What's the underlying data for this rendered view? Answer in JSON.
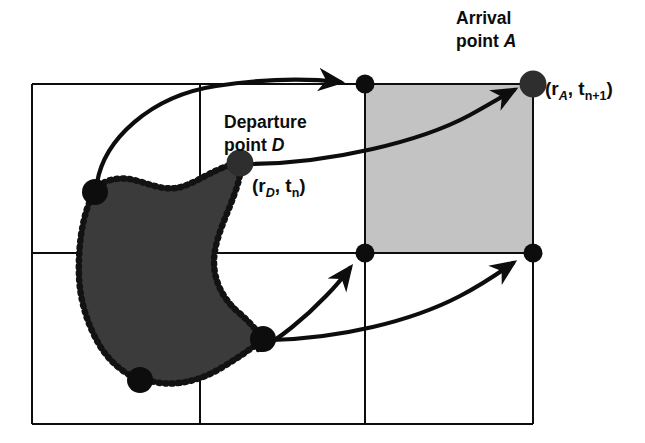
{
  "figure": {
    "kind": "semi-lagrangian-advection-diagram",
    "background_color": "#ffffff"
  },
  "labels": {
    "arrival_line1": "Arrival",
    "arrival_line2_prefix": "point ",
    "arrival_line2_symbol": "A",
    "arrival_coord_open": "(r",
    "arrival_coord_sub1": "A",
    "arrival_coord_mid": ", t",
    "arrival_coord_sub2": "n+1",
    "arrival_coord_close": ")",
    "departure_line1": "Departure",
    "departure_line2_prefix": "point ",
    "departure_line2_symbol": "D",
    "departure_coord_open": "(r",
    "departure_coord_sub1": "D",
    "departure_coord_mid": ", t",
    "departure_coord_sub2": "n",
    "departure_coord_close": ")"
  },
  "colors": {
    "grid_line": "#0d0d0d",
    "highlight_cell": "#c3c3c3",
    "blob_fill": "#3b3b3b",
    "blob_border": "#121212",
    "marker": "#0d0d0d",
    "arrow": "#0d0d0d",
    "text": "#0d0d0d",
    "background": "#ffffff"
  },
  "grid": {
    "x_lines": [
      32,
      200,
      365,
      533
    ],
    "y_lines": [
      84,
      253,
      424
    ],
    "line_width": 2.4,
    "columns": 3,
    "rows": 2
  },
  "highlight_cell": {
    "x": 365,
    "y": 84,
    "width": 168,
    "height": 169,
    "note": "shaded target grid cell containing arrival point A"
  },
  "markers": [
    {
      "name": "departure-point-D",
      "x": 240,
      "y": 163,
      "r": 13.5,
      "fill": "#2e2e2e"
    },
    {
      "name": "arrival-point-A",
      "x": 533,
      "y": 84,
      "r": 13.5,
      "fill": "#2e2e2e"
    },
    {
      "name": "blob-vertex-left",
      "x": 95,
      "y": 192,
      "r": 13.0,
      "fill": "#0d0d0d"
    },
    {
      "name": "blob-vertex-bottom-left",
      "x": 140,
      "y": 380,
      "r": 13.0,
      "fill": "#0d0d0d"
    },
    {
      "name": "blob-vertex-right",
      "x": 263,
      "y": 339,
      "r": 13.0,
      "fill": "#0d0d0d"
    },
    {
      "name": "grid-node-top-middle",
      "x": 365,
      "y": 84,
      "r": 9.5,
      "fill": "#0d0d0d"
    },
    {
      "name": "grid-node-center-right",
      "x": 365,
      "y": 253,
      "r": 9.5,
      "fill": "#0d0d0d"
    },
    {
      "name": "grid-node-middle-right",
      "x": 533,
      "y": 253,
      "r": 9.5,
      "fill": "#0d0d0d"
    }
  ],
  "trajectories": [
    {
      "name": "arrow-left-vertex-to-top-node",
      "from": "blob-vertex-left",
      "to": "grid-node-top-middle",
      "path": "M 97 183 C 104 140 150 96 216 86 C 262 79 305 78 340 82"
    },
    {
      "name": "arrow-departure-to-arrival",
      "from": "departure-point-D",
      "to": "arrival-point-A",
      "path": "M 252 164 C 330 163 420 142 470 115 C 490 104 503 96 514 90"
    },
    {
      "name": "arrow-right-vertex-to-center-node",
      "from": "blob-vertex-right",
      "to": "grid-node-center-right",
      "path": "M 258 350 C 278 340 305 318 326 296 C 336 286 344 276 350 268"
    },
    {
      "name": "arrow-right-vertex-to-middle-right-node",
      "from": "blob-vertex-right",
      "to": "grid-node-middle-right",
      "path": "M 272 340 C 340 338 410 322 460 296 C 485 283 500 272 513 263"
    }
  ],
  "blob": {
    "name": "advected-fluid-parcel",
    "fill": "#3b3b3b",
    "border_style": "dotted",
    "path": "M 95 192 C 100 180 118 176 134 180 C 150 184 162 190 176 188 C 190 186 205 175 222 168 C 232 164 238 163 240 163 C 242 176 236 190 230 206 C 222 226 214 244 214 262 C 214 280 222 298 238 312 C 250 322 258 332 263 339 C 250 350 232 362 214 372 C 195 382 172 386 155 382 C 146 380 142 380 140 380 C 124 374 110 362 100 346 C 88 326 80 302 79 276 C 78 248 82 222 88 206 C 91 198 93 194 95 192 Z"
  }
}
